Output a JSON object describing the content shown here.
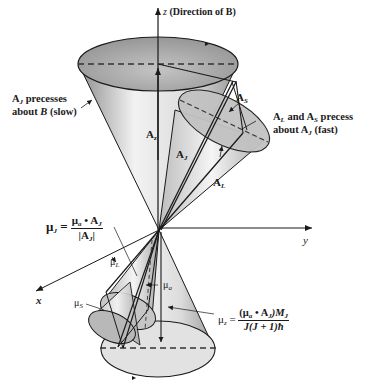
{
  "axes": {
    "z_label": "z",
    "z_note": "(Direction of B)",
    "y_label": "y",
    "x_label": "x"
  },
  "labels": {
    "AJ_precess_line1": "A",
    "AJ_precess_sub": "J",
    "AJ_precess_text1": " precesses",
    "AJ_precess_line2a": "about ",
    "AJ_precess_B": "B",
    "AJ_precess_line2b": " (slow)",
    "As": "A",
    "As_sub": "S",
    "Az": "A",
    "Az_sub": "z",
    "AJ": "A",
    "AJ_sub": "J",
    "AL": "A",
    "AL_sub": "L",
    "fast_line1_a": "A",
    "fast_line1_a_sub": "L",
    "fast_line1_and": " and ",
    "fast_line1_b": "A",
    "fast_line1_b_sub": "S",
    "fast_line1_end": " precess",
    "fast_line2_a": "about ",
    "fast_line2_b": "A",
    "fast_line2_b_sub": "J",
    "fast_line2_end": " (fast)",
    "muL": "μ",
    "muL_sub": "L",
    "muS": "μ",
    "muS_sub": "S",
    "mua": "μ",
    "mua_sub": "a"
  },
  "equations": {
    "muJ": {
      "lhs": "μ",
      "lhs_sub": "J",
      "eq": " = ",
      "num_mu": "μ",
      "num_mu_sub": "a",
      "num_dot": " • ",
      "num_A": "A",
      "num_A_sub": "J",
      "den_open": "|",
      "den_A": "A",
      "den_A_sub": "J",
      "den_close": "|"
    },
    "muz": {
      "lhs": "μ",
      "lhs_sub": "z",
      "eq": " = ",
      "num": "(μ",
      "num_sub": "a",
      "num_dot": " • ",
      "num_A": "A",
      "num_A_sub": "J",
      "num_close": ")M",
      "num_M_sub": "J",
      "den": "J(J + 1)ħ"
    }
  },
  "colors": {
    "stroke": "#1a1a1a",
    "cone_light": "#f4f4f4",
    "cone_mid": "#c9c9c9",
    "cone_dark": "#8e8e8e",
    "ellipse_fill": "#b3b3b3"
  }
}
